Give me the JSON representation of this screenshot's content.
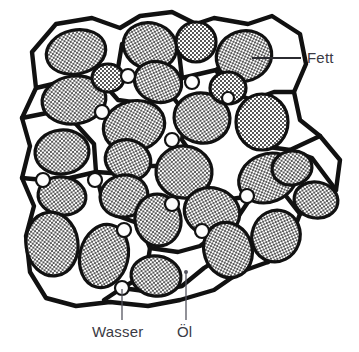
{
  "figure": {
    "background_color": "#ffffff",
    "line_color": "#111111",
    "label_color": "#3b3b44",
    "leader_color": "#555560",
    "globule_fill": "stipple-dot-pattern",
    "droplet_fill": "#fdfdfd"
  },
  "labels": [
    {
      "id": "fett",
      "text": "Fett",
      "x": 307,
      "y": 63,
      "anchor": "start",
      "leader": {
        "x1": 252,
        "y1": 58,
        "x2": 301,
        "y2": 58
      },
      "description": "Leader line from fat globule edge to the right"
    },
    {
      "id": "wasser",
      "text": "Wasser",
      "x": 92,
      "y": 337,
      "anchor": "start",
      "leader": {
        "x1": 122,
        "y1": 289,
        "x2": 122,
        "y2": 320
      },
      "description": "Leader line from water droplet node downward"
    },
    {
      "id": "oel",
      "text": "Öl",
      "x": 177,
      "y": 337,
      "anchor": "start",
      "leader": {
        "x1": 186,
        "y1": 272,
        "x2": 186,
        "y2": 320
      },
      "description": "Leader line from oil (white continuous phase) downward"
    }
  ],
  "legend_items": [
    {
      "key": "fett",
      "label": "Fett",
      "meaning": "stippled globules"
    },
    {
      "key": "wasser",
      "label": "Wasser",
      "meaning": "small white circles at junctions"
    },
    {
      "key": "oel",
      "label": "Öl",
      "meaning": "white continuous phase between walls"
    }
  ],
  "structure": {
    "cell_walls_path": "M 36 88 L 32 52 L 56 24 L 92 18 L 120 28 L 140 16 L 172 12 L 196 24 L 214 18 L 248 24 L 272 16 L 300 34 L 306 64 L 294 92 L 300 120 L 320 136 L 340 160 L 336 190 L 322 206 L 300 214 L 290 240 L 268 262 L 240 272 L 214 290 L 180 300 L 148 306 L 110 302 L 76 306 L 46 298 L 30 272 L 26 236 L 34 206 L 22 178 L 30 146 L 22 118 Z",
    "inner_wall_paths": [
      "M 36 88 L 70 80 L 104 84 L 118 68 L 122 44",
      "M 104 84 L 118 100 L 146 104 L 172 96 L 182 78 L 178 44",
      "M 172 96 L 186 114 L 182 140 L 196 160",
      "M 182 78 L 216 70 L 236 58 L 250 40",
      "M 216 70 L 230 92 L 252 100 L 274 92 L 294 92",
      "M 252 100 L 248 126 L 262 146 L 290 150 L 320 136",
      "M 22 118 L 52 112 L 76 124 L 94 144 L 96 172",
      "M 96 172 L 126 174 L 150 166 L 176 166 L 196 160",
      "M 196 160 L 206 186 L 224 200 L 252 196 L 268 178 L 290 150",
      "M 22 178 L 44 180 L 70 178 L 96 172",
      "M 96 172 L 102 198 L 118 216 L 140 224 L 150 248",
      "M 150 248 L 178 252 L 200 246 L 222 230 L 224 200",
      "M 150 248 L 146 274 L 122 288 L 104 300",
      "M 122 288 L 152 292 L 182 286 L 204 268 L 226 254 L 252 244 L 268 262",
      "M 226 254 L 232 226 L 252 196",
      "M 290 150 L 312 158 L 336 190",
      "M 268 178 L 286 196 L 300 214"
    ],
    "globules": [
      {
        "cx": 76,
        "cy": 52,
        "rx": 30,
        "ry": 22,
        "rot": -12
      },
      {
        "cx": 150,
        "cy": 46,
        "rx": 27,
        "ry": 23,
        "rot": 15
      },
      {
        "cx": 196,
        "cy": 42,
        "rx": 20,
        "ry": 20,
        "rot": 0
      },
      {
        "cx": 244,
        "cy": 56,
        "rx": 28,
        "ry": 25,
        "rot": -20
      },
      {
        "cx": 74,
        "cy": 100,
        "rx": 32,
        "ry": 24,
        "rot": -8
      },
      {
        "cx": 158,
        "cy": 82,
        "rx": 24,
        "ry": 20,
        "rot": 20
      },
      {
        "cx": 134,
        "cy": 126,
        "rx": 31,
        "ry": 25,
        "rot": -15
      },
      {
        "cx": 202,
        "cy": 118,
        "rx": 28,
        "ry": 25,
        "rot": 10
      },
      {
        "cx": 262,
        "cy": 122,
        "rx": 26,
        "ry": 28,
        "rot": 0
      },
      {
        "cx": 62,
        "cy": 152,
        "rx": 27,
        "ry": 22,
        "rot": -5
      },
      {
        "cx": 62,
        "cy": 196,
        "rx": 24,
        "ry": 19,
        "rot": 8
      },
      {
        "cx": 128,
        "cy": 160,
        "rx": 23,
        "ry": 20,
        "rot": 18
      },
      {
        "cx": 124,
        "cy": 196,
        "rx": 24,
        "ry": 21,
        "rot": -12
      },
      {
        "cx": 184,
        "cy": 172,
        "rx": 28,
        "ry": 26,
        "rot": 5
      },
      {
        "cx": 268,
        "cy": 178,
        "rx": 30,
        "ry": 24,
        "rot": -22
      },
      {
        "cx": 316,
        "cy": 200,
        "rx": 22,
        "ry": 18,
        "rot": 10
      },
      {
        "cx": 52,
        "cy": 244,
        "rx": 26,
        "ry": 32,
        "rot": -8
      },
      {
        "cx": 104,
        "cy": 256,
        "rx": 24,
        "ry": 32,
        "rot": 14
      },
      {
        "cx": 158,
        "cy": 220,
        "rx": 23,
        "ry": 26,
        "rot": -10
      },
      {
        "cx": 212,
        "cy": 212,
        "rx": 28,
        "ry": 24,
        "rot": 16
      },
      {
        "cx": 156,
        "cy": 276,
        "rx": 25,
        "ry": 20,
        "rot": 8
      },
      {
        "cx": 228,
        "cy": 250,
        "rx": 24,
        "ry": 28,
        "rot": -18
      },
      {
        "cx": 276,
        "cy": 236,
        "rx": 24,
        "ry": 26,
        "rot": 20
      },
      {
        "cx": 292,
        "cy": 168,
        "rx": 20,
        "ry": 17,
        "rot": -10
      },
      {
        "cx": 228,
        "cy": 88,
        "rx": 18,
        "ry": 16,
        "rot": 0
      },
      {
        "cx": 108,
        "cy": 78,
        "rx": 16,
        "ry": 14,
        "rot": 0
      }
    ],
    "water_droplets": [
      {
        "cx": 128,
        "cy": 76,
        "r": 7
      },
      {
        "cx": 192,
        "cy": 82,
        "r": 7
      },
      {
        "cx": 228,
        "cy": 98,
        "r": 6
      },
      {
        "cx": 102,
        "cy": 112,
        "r": 7
      },
      {
        "cx": 172,
        "cy": 140,
        "r": 7
      },
      {
        "cx": 43,
        "cy": 180,
        "r": 7
      },
      {
        "cx": 95,
        "cy": 180,
        "r": 7
      },
      {
        "cx": 247,
        "cy": 196,
        "r": 7
      },
      {
        "cx": 172,
        "cy": 204,
        "r": 7
      },
      {
        "cx": 124,
        "cy": 230,
        "r": 7
      },
      {
        "cx": 202,
        "cy": 231,
        "r": 7
      },
      {
        "cx": 122,
        "cy": 288,
        "r": 7
      }
    ],
    "oil_marker": {
      "cx": 186,
      "cy": 272,
      "r": 2
    }
  }
}
